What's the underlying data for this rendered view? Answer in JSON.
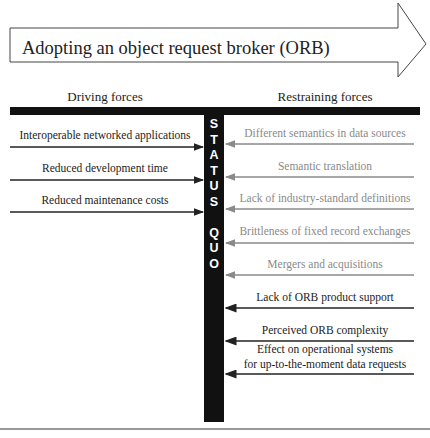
{
  "title": "Adopting an object request broker (ORB)",
  "columns": {
    "driving": "Driving forces",
    "restraining": "Restraining forces"
  },
  "status_quo": [
    "S",
    "T",
    "A",
    "T",
    "U",
    "S",
    "",
    "Q",
    "U",
    "O"
  ],
  "driving_forces": [
    {
      "label": "Interoperable networked applications",
      "y": 148
    },
    {
      "label": "Reduced development time",
      "y": 181
    },
    {
      "label": "Reduced maintenance costs",
      "y": 213
    }
  ],
  "restraining_forces": [
    {
      "label": "Different semantics in data sources",
      "y": 145,
      "tone": "gray"
    },
    {
      "label": "Semantic translation",
      "y": 178,
      "tone": "gray"
    },
    {
      "label": "Lack of industry-standard definitions",
      "y": 210,
      "tone": "gray"
    },
    {
      "label": "Brittleness of fixed record exchanges",
      "y": 243,
      "tone": "gray"
    },
    {
      "label": "Mergers and acquisitions",
      "y": 275,
      "tone": "gray"
    },
    {
      "label": "Lack of ORB product support",
      "y": 308,
      "tone": "dark"
    },
    {
      "label": "Perceived ORB complexity",
      "y": 341,
      "tone": "dark"
    },
    {
      "label": "Effect on operational systems",
      "label2": "for up-to-the-moment data requests",
      "y": 374,
      "tone": "dark"
    }
  ],
  "colors": {
    "pole": "#111111",
    "driving_arrow": "#222222",
    "restraining_gray": "#8a8a8a",
    "restraining_dark": "#222222"
  }
}
